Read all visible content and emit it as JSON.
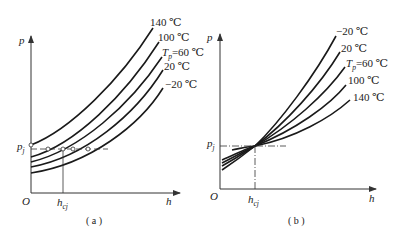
{
  "figure": {
    "panel_a": {
      "caption": "( a )",
      "y_axis_label": "p",
      "x_axis_label": "h",
      "origin_label": "O",
      "pj_label": "p",
      "pj_sub": "j",
      "hcj_label": "h",
      "hcj_sub": "cj",
      "curve_labels": [
        {
          "text": "140 ℃"
        },
        {
          "text": "100 ℃"
        },
        {
          "prefix": "T",
          "sub": "p",
          "text": "=60 ℃"
        },
        {
          "text": "20 ℃"
        },
        {
          "text": "−20 ℃"
        }
      ],
      "description": "Pressure p vs. height h curves for different temperatures; higher temperature gives higher pressure at all h. Horizontal dashed line at p_j intersects curves at marked points; vertical line at h_cj."
    },
    "panel_b": {
      "caption": "( b )",
      "y_axis_label": "p",
      "x_axis_label": "h",
      "origin_label": "O",
      "pj_label": "p",
      "pj_sub": "j",
      "hcj_label": "h",
      "hcj_sub": "cj",
      "curve_labels": [
        {
          "text": "−20 ℃"
        },
        {
          "text": "20 ℃"
        },
        {
          "prefix": "T",
          "sub": "p",
          "text": "=60 ℃"
        },
        {
          "text": "100 ℃"
        },
        {
          "text": "140 ℃"
        }
      ],
      "description": "All temperature curves cross at a common point (h_cj, p_j); beyond it lower temperature gives steeper rise."
    }
  }
}
